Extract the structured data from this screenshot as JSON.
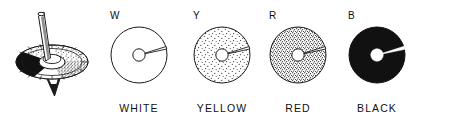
{
  "figure": {
    "background_color": "#ffffff",
    "ink_color": "#1a1a1a"
  },
  "top_illustration": {
    "name": "spinning-top",
    "parts": {
      "spindle": "spindle-rod",
      "hub": "center-hub",
      "disc": "segmented-disc",
      "tip": "pointed-tip"
    },
    "sectors": [
      {
        "name": "black-sector",
        "fill": "#111111"
      },
      {
        "name": "white-sector",
        "fill": "#ffffff"
      },
      {
        "name": "light-stipple-sector",
        "fill": "#d8d8d8"
      },
      {
        "name": "dense-stipple-sector",
        "fill": "#aaaaaa"
      }
    ]
  },
  "discs": [
    {
      "letter": "W",
      "caption": "WHITE",
      "fill_color": "#ffffff",
      "pattern": "plain",
      "slot_color": "#ffffff",
      "hub_color": "#ffffff",
      "cx": 139,
      "cy": 55,
      "r": 28
    },
    {
      "letter": "Y",
      "caption": "YELLOW",
      "fill_color": "#f2f2f2",
      "pattern": "sparse-stipple",
      "slot_color": "#ffffff",
      "hub_color": "#ffffff",
      "cx": 222,
      "cy": 55,
      "r": 28
    },
    {
      "letter": "R",
      "caption": "RED",
      "fill_color": "#d9d9d9",
      "pattern": "dense-stipple",
      "slot_color": "#ffffff",
      "hub_color": "#ffffff",
      "cx": 298,
      "cy": 55,
      "r": 28
    },
    {
      "letter": "B",
      "caption": "BLACK",
      "fill_color": "#111111",
      "pattern": "solid",
      "slot_color": "#ffffff",
      "hub_color": "#ffffff",
      "cx": 377,
      "cy": 55,
      "r": 28
    }
  ]
}
